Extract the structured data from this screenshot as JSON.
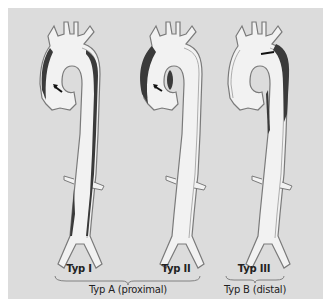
{
  "diagram": {
    "background_color": "#dcdcdc",
    "vessel_fill": "#f2f2f2",
    "vessel_outline": "#7a7a7a",
    "false_lumen_color": "#3a3a3a",
    "types": [
      {
        "id": "typ-1",
        "label": "Typ I",
        "dissection": "ascending + arch + descending to iliac"
      },
      {
        "id": "typ-2",
        "label": "Typ II",
        "dissection": "ascending aorta only"
      },
      {
        "id": "typ-3",
        "label": "Typ III",
        "dissection": "descending aorta (distal to left subclavian)"
      }
    ],
    "groups": [
      {
        "id": "typ-a",
        "label": "Typ A (proximal)",
        "members": [
          "Typ I",
          "Typ II"
        ]
      },
      {
        "id": "typ-b",
        "label": "Typ B (distal)",
        "members": [
          "Typ III"
        ]
      }
    ]
  }
}
